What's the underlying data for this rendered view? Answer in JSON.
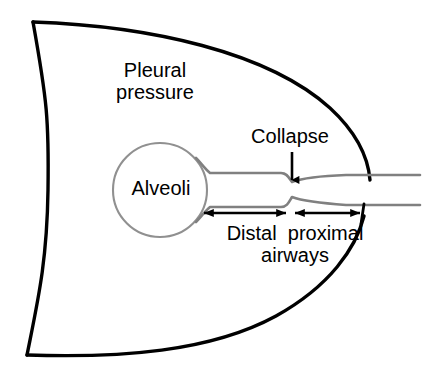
{
  "figure": {
    "kind": "anatomical-diagram",
    "background_color": "#ffffff"
  },
  "labels": {
    "pleural_pressure_line1": "Pleural",
    "pleural_pressure_line2": "pressure",
    "collapse": "Collapse",
    "alveoli": "Alveoli",
    "airways_line1": "Distal  proximal",
    "airways_line2": "airways"
  },
  "colors": {
    "pleura_outline": "#000000",
    "airway_wall": "#808080",
    "alveolus_outline": "#909090",
    "arrow": "#000000",
    "text": "#000000",
    "background": "#ffffff"
  },
  "shapes": {
    "pleura": {
      "name": "pleural-boundary",
      "stroke_width": 3.2,
      "corner_top_left": [
        33,
        22
      ],
      "corner_bottom_left": [
        27,
        355
      ]
    },
    "alveolus": {
      "name": "alveolus-circle",
      "center": [
        160,
        190
      ],
      "radius": 47,
      "stroke_width": 2
    },
    "airway": {
      "name": "airway-lumen",
      "stroke_width": 2.4,
      "collapse_x": 291,
      "distal_start_x": 203,
      "proximal_end_x": 420
    }
  },
  "arrows": {
    "collapse_arrow": {
      "name": "collapse-arrow",
      "direction": "down",
      "x": 292,
      "y_start": 152,
      "y_end": 183
    },
    "distal_span": {
      "name": "distal-span-arrow",
      "double_headed": true,
      "y": 213,
      "x_start": 203,
      "x_end": 287
    },
    "proximal_span": {
      "name": "proximal-span-arrow",
      "double_headed": true,
      "y": 213,
      "x_start": 294,
      "x_end": 362
    }
  }
}
